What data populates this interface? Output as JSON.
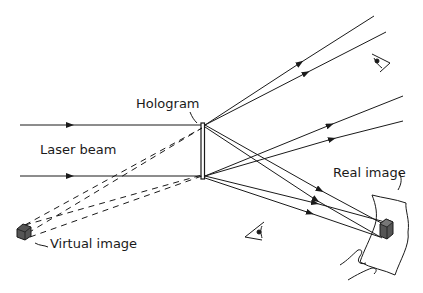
{
  "diagram": {
    "labels": {
      "hologram": "Hologram",
      "laser_beam": "Laser beam",
      "virtual_image": "Virtual image",
      "real_image": "Real image"
    },
    "colors": {
      "line": "#1a1a1a",
      "cube_fill": "#555555",
      "cube_top": "#777777"
    }
  }
}
